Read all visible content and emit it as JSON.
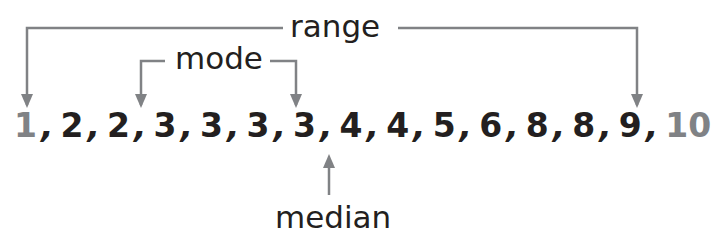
{
  "labels": {
    "range": "range",
    "mode": "mode",
    "median": "median"
  },
  "data_set": [
    "1",
    "2",
    "2",
    "3",
    "3",
    "3",
    "3",
    "4",
    "4",
    "5",
    "6",
    "8",
    "8",
    "9",
    "10"
  ],
  "separator": ",",
  "highlight": {
    "range_endpoints": [
      "1",
      "10"
    ],
    "mode_value": "3",
    "median_value": "4"
  },
  "colors": {
    "text": "#231f20",
    "highlight_number": "#808285",
    "arrow": "#808285"
  }
}
